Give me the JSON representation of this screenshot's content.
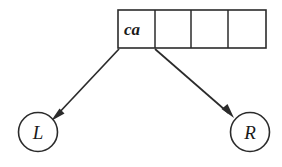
{
  "diagram": {
    "type": "pointer-array-diagram",
    "background_color": "#ffffff",
    "ink_color": "#2b2b2b",
    "array": {
      "label": "array-of-cells",
      "cell_count": 4,
      "cells": [
        {
          "index": 0,
          "text": "ca",
          "empty": false
        },
        {
          "index": 1,
          "text": "",
          "empty": true
        },
        {
          "index": 2,
          "text": "",
          "empty": true
        },
        {
          "index": 3,
          "text": "",
          "empty": true
        }
      ],
      "geometry": {
        "x": 118,
        "y": 10,
        "width": 148,
        "height": 38,
        "cell_width": 37,
        "dividers_x": [
          155,
          191,
          228
        ]
      }
    },
    "nodes": [
      {
        "id": "left-node",
        "label": "L",
        "shape": "circle",
        "cx": 38,
        "cy": 132,
        "r": 19.5
      },
      {
        "id": "right-node",
        "label": "R",
        "shape": "circle",
        "cx": 250,
        "cy": 132,
        "r": 19.5
      }
    ],
    "arrows": [
      {
        "id": "arrow-to-left-node",
        "from": "array-cell-0-bottom-left",
        "to": "left-node",
        "start": {
          "x": 119,
          "y": 49
        },
        "end": {
          "x": 53,
          "y": 118
        },
        "direction": "down-left",
        "has_arrowhead": true
      },
      {
        "id": "arrow-to-right-node",
        "from": "array-cell-0-bottom-right",
        "to": "right-node",
        "start": {
          "x": 155,
          "y": 49
        },
        "end": {
          "x": 232,
          "y": 116
        },
        "direction": "down-right",
        "has_arrowhead": true
      }
    ]
  }
}
